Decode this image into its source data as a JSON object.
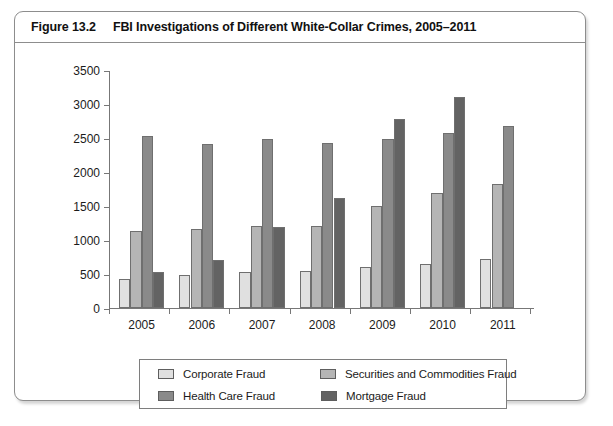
{
  "figure": {
    "number": "Figure 13.2",
    "title": "FBI Investigations of Different White-Collar Crimes, 2005–2011"
  },
  "colors": {
    "corporate_fraud": "#e0e0e0",
    "securities_and_commodities_fraud": "#b5b5b5",
    "health_care_fraud": "#8a8a8a",
    "mortgage_fraud": "#636363",
    "axis": "#777777",
    "frame": "#8d8d8d",
    "text": "#1b1b1b"
  },
  "legend": {
    "items": [
      {
        "label": "Corporate Fraud",
        "color": "#e0e0e0",
        "swatch": "legend-swatch-corporate-fraud"
      },
      {
        "label": "Securities and Commodities Fraud",
        "color": "#b5b5b5",
        "swatch": "legend-swatch-securities-and-commodities-fraud"
      },
      {
        "label": "Health Care Fraud",
        "color": "#8a8a8a",
        "swatch": "legend-swatch-health-care-fraud"
      },
      {
        "label": "Mortgage Fraud",
        "color": "#636363",
        "swatch": "legend-swatch-mortgage-fraud"
      }
    ]
  },
  "chart_data": {
    "type": "bar",
    "title": "FBI Investigations of Different White-Collar Crimes, 2005–2011",
    "subtitle": "",
    "xlabel": "",
    "ylabel": "",
    "categories": [
      "2005",
      "2006",
      "2007",
      "2008",
      "2009",
      "2010",
      "2011"
    ],
    "series": [
      {
        "name": "Corporate Fraud",
        "color": "#e0e0e0",
        "values": [
          425,
          480,
          530,
          545,
          600,
          650,
          720
        ]
      },
      {
        "name": "Securities and Commodities Fraud",
        "color": "#b5b5b5",
        "values": [
          1130,
          1160,
          1210,
          1205,
          1500,
          1690,
          1825
        ]
      },
      {
        "name": "Health Care Fraud",
        "color": "#8a8a8a",
        "values": [
          2530,
          2410,
          2490,
          2430,
          2490,
          2570,
          2675
        ]
      },
      {
        "name": "Mortgage Fraud",
        "color": "#636363",
        "values": [
          530,
          710,
          1190,
          1620,
          2780,
          3110,
          null
        ]
      }
    ],
    "ylim": [
      0,
      3500
    ],
    "yticks": [
      0,
      500,
      1000,
      1500,
      2000,
      2500,
      3000,
      3500
    ],
    "ytick_labels": [
      "0",
      "500",
      "1000",
      "1500",
      "2000",
      "2500",
      "3000",
      "3500"
    ],
    "grid": false,
    "legend_position": "bottom"
  }
}
